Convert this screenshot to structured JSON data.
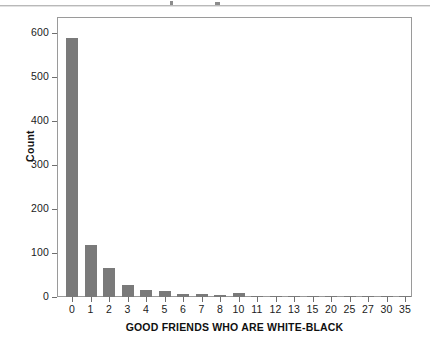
{
  "chart_data": {
    "type": "bar",
    "title": "",
    "xlabel": "GOOD FRIENDS WHO ARE WHITE-BLACK",
    "ylabel": "Count",
    "categories": [
      "0",
      "1",
      "2",
      "3",
      "4",
      "5",
      "6",
      "7",
      "8",
      "10",
      "11",
      "12",
      "13",
      "15",
      "20",
      "25",
      "27",
      "30",
      "35"
    ],
    "values": [
      589,
      118,
      66,
      27,
      16,
      13,
      7,
      6,
      5,
      8,
      2,
      2,
      2,
      1,
      2,
      1,
      1,
      1,
      2
    ],
    "ylim": [
      0,
      600
    ],
    "yticks": [
      "0",
      "100",
      "200",
      "300",
      "400",
      "500",
      "600"
    ],
    "ytick_values": [
      0,
      100,
      200,
      300,
      400,
      500,
      600
    ],
    "grid": false,
    "legend": "none",
    "bar_color": "#7a7a7a",
    "frame_color": "#9a9a9a",
    "background": "#ffffff"
  },
  "figure": {
    "axis_label_color": "#1b1b1b"
  }
}
